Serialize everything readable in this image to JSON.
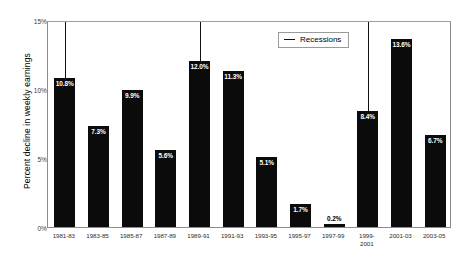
{
  "chart_data": {
    "type": "bar",
    "title": "",
    "xlabel": "",
    "ylabel": "Percent decline in weekly earnings",
    "ylim": [
      0,
      15
    ],
    "ytick_labels": [
      "0%",
      "5%",
      "10%",
      "15%"
    ],
    "ytick_values": [
      0,
      5,
      10,
      15
    ],
    "grid": false,
    "categories": [
      "1981-83",
      "1983-85",
      "1985-87",
      "1987-89",
      "1989-91",
      "1991-93",
      "1993-95",
      "1995-97",
      "1997-99",
      "1999-\n2001",
      "2001-03",
      "2003-05"
    ],
    "values": [
      10.8,
      7.3,
      9.9,
      5.6,
      12.0,
      11.3,
      5.1,
      1.7,
      0.2,
      8.4,
      13.6,
      6.7
    ],
    "value_labels": [
      "10.8%",
      "7.3%",
      "9.9%",
      "5.6%",
      "12.0%",
      "11.3%",
      "5.1%",
      "1.7%",
      "0.2%",
      "8.4%",
      "13.6%",
      "6.7%"
    ],
    "bar_color": "#0b0b0b",
    "legend": {
      "position": "top-right",
      "entries": [
        {
          "label": "Recessions",
          "marker": "line",
          "color": "#111111"
        }
      ]
    },
    "annotations": {
      "recession_line_categories": [
        "1981-83",
        "1989-91",
        "1999-\n2001"
      ],
      "recession_line_indices": [
        0,
        4,
        9
      ]
    }
  }
}
